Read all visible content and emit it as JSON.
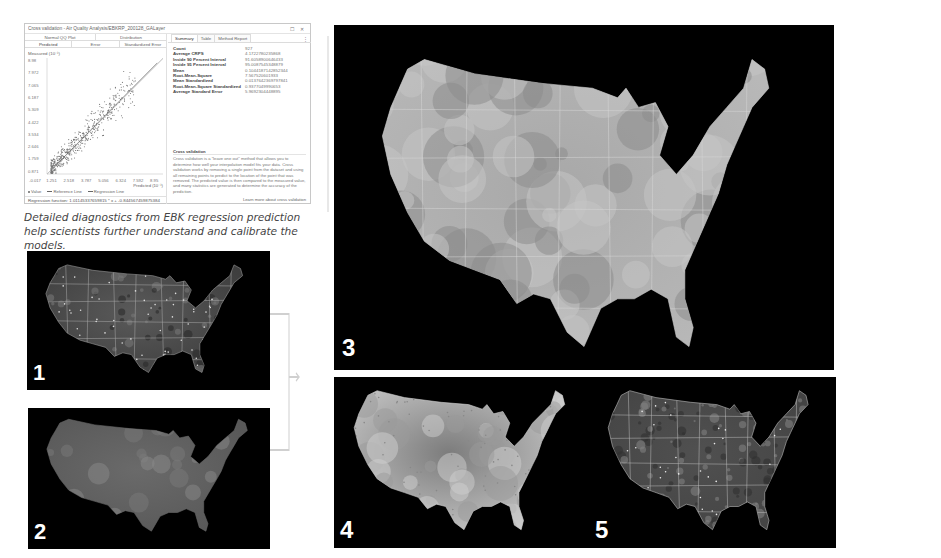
{
  "window": {
    "title": "Cross validation - Air Quality Analysis/EBKRP_200128_GALayer",
    "buttons": {
      "restore": "☐",
      "close": "✕"
    }
  },
  "plot_tabs": {
    "row1": [
      "Normal QQ Plot",
      "Distribution"
    ],
    "row2": [
      "Predicted",
      "Error",
      "Standardized Error"
    ],
    "active": "Predicted"
  },
  "summary_tabs": {
    "tabs": [
      "Summary",
      "Table",
      "Method Report"
    ],
    "active": "Summary",
    "menu_icon": "⋮"
  },
  "summary_stats": [
    {
      "label": "Count",
      "value": "927"
    },
    {
      "label": "Average CRPS",
      "value": "4.1722780235868"
    },
    {
      "label": "Inside 90 Percent Interval",
      "value": "91.6058900646433"
    },
    {
      "label": "Inside 95 Percent Interval",
      "value": "95.0087545348879"
    },
    {
      "label": "Mean",
      "value": "0.1044187142852344"
    },
    {
      "label": "Root-Mean-Square",
      "value": "7.567520601933"
    },
    {
      "label": "Mean Standardized",
      "value": "0.0137642369797841"
    },
    {
      "label": "Root-Mean-Square Standardized",
      "value": "0.9377049990653"
    },
    {
      "label": "Average Standard Error",
      "value": "5.9692304448895"
    }
  ],
  "info": {
    "heading": "Cross validation",
    "body": "Cross validation is a \"leave one out\" method that allows you to determine how well your interpolation model fits your data. Cross validation works by removing a single point from the dataset and using all remaining points to predict to the location of the point that was removed. The predicted value is then compared to the measured value, and many statistics are generated to determine the accuracy of the prediction.",
    "link": "Learn more about cross validation"
  },
  "chart_data": {
    "type": "scatter",
    "title": "",
    "ylabel": "Measured (10⁻¹)",
    "xlabel": "Predicted (10⁻¹)",
    "y_ticks": [
      "8.98",
      "7.972",
      "7.065",
      "6.187",
      "5.309",
      "4.422",
      "3.534",
      "2.646",
      "1.759",
      "0.871"
    ],
    "x_ticks": [
      "-0.017",
      "1.251",
      "2.518",
      "3.787",
      "5.056",
      "6.324",
      "7.592",
      "8.95"
    ],
    "xlim": [
      -0.017,
      8.95
    ],
    "ylim": [
      0.0,
      8.98
    ],
    "legend": [
      "Value",
      "Reference Line",
      "Regression Line"
    ],
    "regression": {
      "slope": 1.01145337659,
      "intercept": -0.844567459
    },
    "regression_function": "Regression function: 1.01145337659815 * x + -0.844567459875384",
    "n_points": 927
  },
  "caption": "Detailed diagnostics from EBK regression prediction help scientists further understand and calibrate the models.",
  "maps": [
    {
      "id": "map1",
      "label": "1",
      "style": "state boundaries with monitoring points"
    },
    {
      "id": "map2",
      "label": "2",
      "style": "smooth gray surface"
    },
    {
      "id": "map3",
      "label": "3",
      "style": "EBK regression prediction surface"
    },
    {
      "id": "map4",
      "label": "4",
      "style": "light interpolated surface with points"
    },
    {
      "id": "map5",
      "label": "5",
      "style": "textured raster with state boundaries"
    }
  ]
}
